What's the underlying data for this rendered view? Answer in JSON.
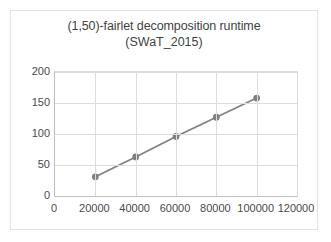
{
  "chart_data": {
    "type": "line",
    "title": "(1,50)-fairlet decomposition runtime",
    "subtitle": "(SWaT_2015)",
    "xlabel": "",
    "ylabel": "",
    "x": [
      20000,
      40000,
      60000,
      80000,
      100000
    ],
    "values": [
      31,
      63,
      96,
      127,
      158
    ],
    "series": [
      {
        "name": "runtime",
        "x": [
          20000,
          40000,
          60000,
          80000,
          100000
        ],
        "values": [
          31,
          63,
          96,
          127,
          158
        ]
      }
    ],
    "xlim": [
      0,
      120000
    ],
    "ylim": [
      0,
      200
    ],
    "xticks": [
      0,
      20000,
      40000,
      60000,
      80000,
      100000,
      120000
    ],
    "yticks": [
      0,
      50,
      100,
      150,
      200
    ],
    "xtick_labels": [
      "0",
      "20000",
      "40000",
      "60000",
      "80000",
      "100000",
      "120000"
    ],
    "ytick_labels": [
      "0",
      "50",
      "100",
      "150",
      "200"
    ],
    "grid": true,
    "legend": false,
    "series_color": "#808080",
    "grid_color": "#dcdcdc",
    "marker": "circle"
  }
}
